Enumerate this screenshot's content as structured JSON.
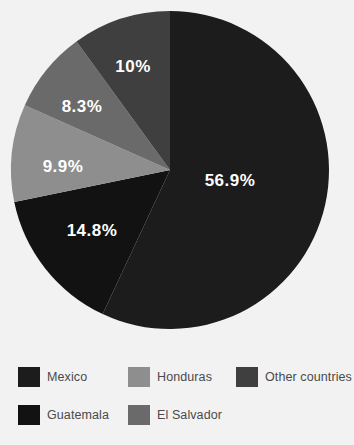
{
  "background_color": "#f2f2f2",
  "chart_data": {
    "type": "pie",
    "title": "",
    "subtitle": "",
    "xlabel": "",
    "ylabel": "",
    "grid": false,
    "legend_position": "bottom",
    "legend_columns": 3,
    "start_angle_deg": 0,
    "direction": "clockwise",
    "units": "percent",
    "center": {
      "cx": 170,
      "cy": 170,
      "r": 159
    },
    "categories": [
      "Mexico",
      "Guatemala",
      "Honduras",
      "El Salvador",
      "Other countries"
    ],
    "values": [
      56.9,
      14.8,
      9.9,
      8.3,
      10.0
    ],
    "labels": [
      "56.9%",
      "14.8%",
      "9.9%",
      "8.3%",
      "10%"
    ],
    "colors": [
      "#1c1c1c",
      "#121212",
      "#8e8e8e",
      "#6a6a6a",
      "#3f3f3f"
    ],
    "slices": [
      {
        "name": "Mexico",
        "value": 56.9,
        "label": "56.9%",
        "color": "#1c1c1c",
        "label_x": 230,
        "label_y": 182
      },
      {
        "name": "Guatemala",
        "value": 14.8,
        "label": "14.8%",
        "color": "#121212",
        "label_x": 92,
        "label_y": 232
      },
      {
        "name": "Honduras",
        "value": 9.9,
        "label": "9.9%",
        "color": "#8e8e8e",
        "label_x": 63,
        "label_y": 168
      },
      {
        "name": "El Salvador",
        "value": 8.3,
        "label": "8.3%",
        "color": "#6a6a6a",
        "label_x": 82,
        "label_y": 108
      },
      {
        "name": "Other countries",
        "value": 10.0,
        "label": "10%",
        "color": "#3f3f3f",
        "label_x": 133,
        "label_y": 68
      }
    ]
  },
  "legend": {
    "items": [
      {
        "label": "Mexico",
        "color": "#1c1c1c"
      },
      {
        "label": "Honduras",
        "color": "#8e8e8e"
      },
      {
        "label": "Other countries",
        "color": "#3f3f3f"
      },
      {
        "label": "Guatemala",
        "color": "#121212"
      },
      {
        "label": "El Salvador",
        "color": "#6a6a6a"
      }
    ]
  }
}
